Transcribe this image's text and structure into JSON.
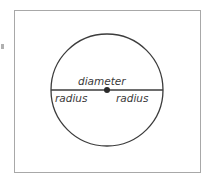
{
  "diagram": {
    "labels": {
      "diameter": "diameter",
      "radius_left": "radius",
      "radius_right": "radius"
    },
    "shapes": {
      "circle": {
        "cx": 107,
        "cy": 90,
        "r": 56,
        "stroke": "#3c3c3c"
      },
      "diameter_line": {
        "x1": 51,
        "y1": 90,
        "x2": 163,
        "y2": 90,
        "stroke": "#3c3c3c"
      },
      "center_point": {
        "cx": 107,
        "cy": 90,
        "r": 3,
        "fill": "#2a2a2a"
      }
    },
    "colors": {
      "frame_border": "#a8a8a8",
      "text": "#3a3a3a",
      "background": "#ffffff"
    }
  }
}
